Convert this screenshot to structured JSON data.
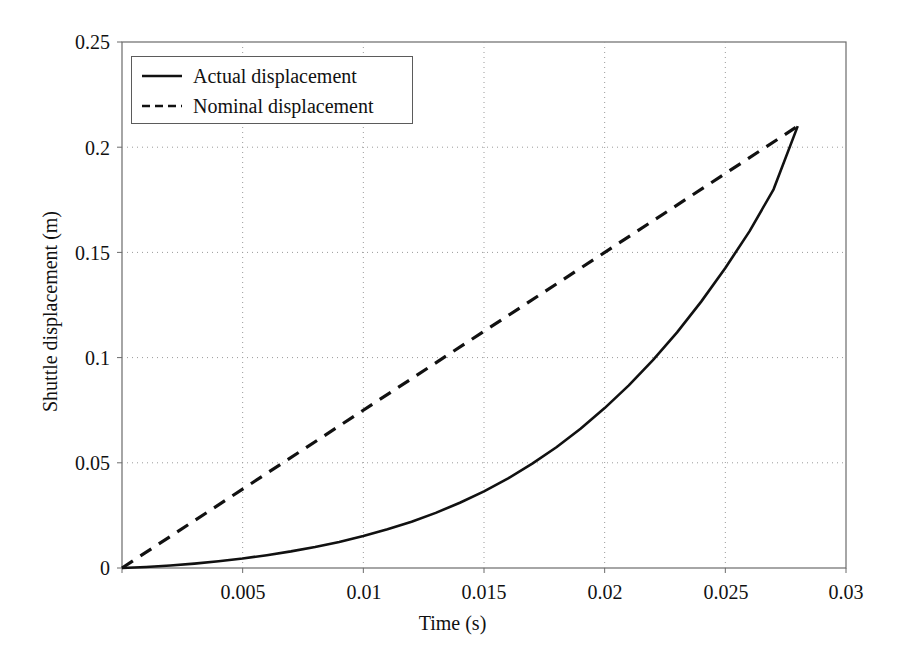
{
  "chart_data": {
    "type": "line",
    "title": "",
    "xlabel": "Time (s)",
    "ylabel": "Shuttle displacement (m)",
    "xlim": [
      0,
      0.03
    ],
    "ylim": [
      0,
      0.25
    ],
    "xticks": [
      0,
      0.005,
      0.01,
      0.015,
      0.02,
      0.025,
      0.03
    ],
    "xticklabels": [
      "",
      "0.005",
      "0.01",
      "0.015",
      "0.02",
      "0.025",
      "0.03"
    ],
    "yticks": [
      0,
      0.05,
      0.1,
      0.15,
      0.2,
      0.25
    ],
    "yticklabels": [
      "0",
      "0.05",
      "0.1",
      "0.15",
      "0.2",
      "0.25"
    ],
    "grid": true,
    "grid_style": "dotted",
    "grid_color": "#9a9a9a",
    "legend_position": "upper left",
    "series": [
      {
        "name": "Actual displacement",
        "style": "solid",
        "color": "#111111",
        "x": [
          0,
          0.001,
          0.002,
          0.003,
          0.004,
          0.005,
          0.006,
          0.007,
          0.008,
          0.009,
          0.01,
          0.011,
          0.012,
          0.013,
          0.014,
          0.015,
          0.016,
          0.017,
          0.018,
          0.019,
          0.02,
          0.021,
          0.022,
          0.023,
          0.024,
          0.025,
          0.026,
          0.027,
          0.028
        ],
        "y": [
          0,
          0.0005,
          0.0012,
          0.0021,
          0.0032,
          0.0045,
          0.0061,
          0.0079,
          0.01,
          0.0124,
          0.0152,
          0.0184,
          0.022,
          0.0262,
          0.031,
          0.0364,
          0.0426,
          0.0496,
          0.0574,
          0.0662,
          0.076,
          0.0868,
          0.0988,
          0.112,
          0.1266,
          0.1426,
          0.16,
          0.18,
          0.21
        ]
      },
      {
        "name": "Nominal displacement",
        "style": "dashed",
        "color": "#111111",
        "x": [
          0,
          0.028
        ],
        "y": [
          0,
          0.21
        ]
      }
    ],
    "annotations": {
      "convergence_point": {
        "x": 0.028,
        "y": 0.21
      }
    }
  },
  "legend": {
    "items": [
      {
        "label": "Actual displacement",
        "style": "solid"
      },
      {
        "label": "Nominal displacement",
        "style": "dashed"
      }
    ]
  },
  "axes": {
    "x_title": "Time (s)",
    "y_title": "Shuttle displacement (m)",
    "x_labels": [
      "0.005",
      "0.01",
      "0.015",
      "0.02",
      "0.025",
      "0.03"
    ],
    "y_labels": [
      "0.25",
      "0.2",
      "0.15",
      "0.1",
      "0.05",
      "0"
    ]
  }
}
